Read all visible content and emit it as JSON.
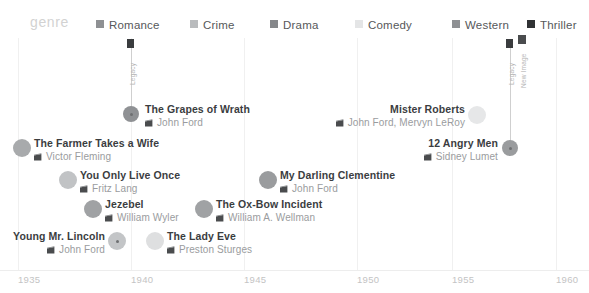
{
  "legend": {
    "title": "genre",
    "items": [
      {
        "label": "Romance",
        "color": "#8e9093",
        "x": 96,
        "swatch_x": 96,
        "text_x": 109
      },
      {
        "label": "Crime",
        "color": "#b9bbbd",
        "x": 190,
        "swatch_x": 190,
        "text_x": 203
      },
      {
        "label": "Drama",
        "color": "#85878a",
        "x": 270,
        "swatch_x": 270,
        "text_x": 283
      },
      {
        "label": "Comedy",
        "color": "#e4e5e6",
        "x": 355,
        "swatch_x": 355,
        "text_x": 368
      },
      {
        "label": "Western",
        "color": "#8e9093",
        "x": 452,
        "swatch_x": 452,
        "text_x": 465
      },
      {
        "label": "Thriller",
        "color": "#303234",
        "x": 527,
        "swatch_x": 527,
        "text_x": 540
      }
    ]
  },
  "axis": {
    "ticks": [
      {
        "label": "1935",
        "x": 18
      },
      {
        "label": "1940",
        "x": 131
      },
      {
        "label": "1945",
        "x": 244
      },
      {
        "label": "1950",
        "x": 357
      },
      {
        "label": "1955",
        "x": 452
      },
      {
        "label": "1960",
        "x": 556
      }
    ],
    "gridlines": [
      18,
      131,
      244,
      357,
      452,
      556
    ]
  },
  "chart_data": {
    "type": "scatter",
    "title": "",
    "xlabel": "",
    "ylabel": "",
    "xlim": [
      1935,
      1960
    ],
    "grid": true,
    "legend_position": "top",
    "categories": [
      "Romance",
      "Crime",
      "Drama",
      "Comedy",
      "Western",
      "Thriller"
    ],
    "points": [
      {
        "title": "The Grapes of Wrath",
        "director": "John Ford",
        "genre": "Drama",
        "color": "#8f9194",
        "dot_x": 131,
        "dot_y": 114,
        "dot_r": 8,
        "text_x": 145,
        "text_y": 103,
        "align": "left"
      },
      {
        "title": "The Farmer Takes a Wife",
        "director": "Victor Fleming",
        "genre": "Romance",
        "color": "#a8aaac",
        "dot_x": 22,
        "dot_y": 148,
        "dot_r": 9,
        "text_x": 34,
        "text_y": 137,
        "align": "left"
      },
      {
        "title": "Mister Roberts",
        "director": "John Ford, Mervyn LeRoy",
        "genre": "Comedy",
        "color": "#e6e7e8",
        "dot_x": 477,
        "dot_y": 115,
        "dot_r": 9,
        "text_x": 465,
        "text_y": 103,
        "align": "right"
      },
      {
        "title": "12 Angry Men",
        "director": "Sidney Lumet",
        "genre": "Thriller",
        "color": "#9a9c9e",
        "dot_x": 510,
        "dot_y": 148,
        "dot_r": 8,
        "text_x": 498,
        "text_y": 137,
        "align": "right"
      },
      {
        "title": "You Only Live Once",
        "director": "Fritz Lang",
        "genre": "Crime",
        "color": "#c1c3c5",
        "dot_x": 68,
        "dot_y": 180,
        "dot_r": 9,
        "text_x": 80,
        "text_y": 169,
        "align": "left"
      },
      {
        "title": "My Darling Clementine",
        "director": "John Ford",
        "genre": "Western",
        "color": "#9a9c9e",
        "dot_x": 268,
        "dot_y": 180,
        "dot_r": 9,
        "text_x": 280,
        "text_y": 169,
        "align": "left"
      },
      {
        "title": "Jezebel",
        "director": "William Wyler",
        "genre": "Romance",
        "color": "#a0a2a4",
        "dot_x": 93,
        "dot_y": 209,
        "dot_r": 9,
        "text_x": 105,
        "text_y": 198,
        "align": "left"
      },
      {
        "title": "The Ox-Bow Incident",
        "director": "William A. Wellman",
        "genre": "Western",
        "color": "#a0a2a4",
        "dot_x": 204,
        "dot_y": 209,
        "dot_r": 9,
        "text_x": 216,
        "text_y": 198,
        "align": "left"
      },
      {
        "title": "Young Mr. Lincoln",
        "director": "John Ford",
        "genre": "Drama",
        "color": "#c3c5c7",
        "dot_x": 117,
        "dot_y": 241,
        "dot_r": 9,
        "text_x": 105,
        "text_y": 230,
        "align": "right"
      },
      {
        "title": "The Lady Eve",
        "director": "Preston Sturges",
        "genre": "Comedy",
        "color": "#dedfe0",
        "dot_x": 155,
        "dot_y": 241,
        "dot_r": 9,
        "text_x": 167,
        "text_y": 230,
        "align": "left"
      }
    ],
    "annotations": [
      {
        "label": "Legacy",
        "stem_x": 131,
        "stem_top": 48,
        "stem_height": 64,
        "cap_w": 7,
        "cap_h": 9,
        "cap_color": "#3a3c3e",
        "label_x": 129,
        "label_y": 85
      },
      {
        "label": "Legacy",
        "stem_x": 510,
        "stem_top": 48,
        "stem_height": 98,
        "cap_w": 7,
        "cap_h": 9,
        "cap_color": "#3a3c3e",
        "label_x": 508,
        "label_y": 85
      },
      {
        "label": "New Image",
        "stem_x": 522,
        "stem_top": 44,
        "stem_height": 0,
        "cap_w": 8,
        "cap_h": 9,
        "cap_color": "#4a4c4e",
        "label_x": 520,
        "label_y": 88
      }
    ]
  }
}
